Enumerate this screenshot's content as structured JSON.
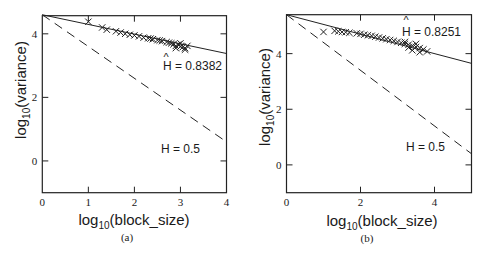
{
  "chart_data": [
    {
      "type": "scatter",
      "panel": "a",
      "caption": "(a)",
      "xlabel": "log10(block_size)",
      "ylabel": "log10(variance)",
      "xlim": [
        0,
        4
      ],
      "ylim": [
        -1,
        4.57
      ],
      "xticks": [
        0,
        1,
        2,
        3,
        4
      ],
      "yticks": [
        0,
        2,
        4
      ],
      "grid": false,
      "legend": null,
      "series": [
        {
          "name": "variance points",
          "marker": "x",
          "x": [
            1.0,
            1.3,
            1.4,
            1.6,
            1.7,
            1.8,
            1.9,
            2.0,
            2.1,
            2.2,
            2.3,
            2.35,
            2.4,
            2.5,
            2.55,
            2.6,
            2.7,
            2.75,
            2.8,
            2.85,
            2.9,
            2.95,
            3.0,
            3.05,
            3.1,
            3.15,
            2.9,
            3.0,
            3.1
          ],
          "y": [
            4.38,
            4.2,
            4.13,
            4.08,
            4.04,
            4.0,
            3.97,
            3.95,
            3.92,
            3.88,
            3.86,
            3.85,
            3.83,
            3.8,
            3.79,
            3.77,
            3.74,
            3.72,
            3.7,
            3.67,
            3.62,
            3.66,
            3.6,
            3.58,
            3.55,
            3.62,
            3.55,
            3.7,
            3.5
          ]
        },
        {
          "name": "fitted line",
          "style": "solid",
          "x": [
            0,
            4
          ],
          "y": [
            4.6,
            3.38
          ]
        },
        {
          "name": "H = 0.5 reference",
          "style": "dashed",
          "x": [
            0,
            4
          ],
          "y": [
            4.6,
            0.6
          ]
        }
      ],
      "annotations": [
        {
          "text": "H = 0.8382",
          "hat": true,
          "x": 2.65,
          "y": 3.0
        },
        {
          "text": "H = 0.5",
          "hat": false,
          "x": 2.63,
          "y": 0.4
        }
      ]
    },
    {
      "type": "scatter",
      "panel": "b",
      "caption": "(b)",
      "xlabel": "log10(block_size)",
      "ylabel": "log10(variance)",
      "xlim": [
        0,
        5
      ],
      "ylim": [
        -1,
        5.4
      ],
      "xticks": [
        0,
        2,
        4
      ],
      "yticks": [
        0,
        2,
        4
      ],
      "grid": false,
      "legend": null,
      "series": [
        {
          "name": "variance points",
          "marker": "x",
          "x": [
            1.0,
            1.3,
            1.4,
            1.5,
            1.6,
            1.7,
            1.9,
            2.0,
            2.1,
            2.2,
            2.3,
            2.4,
            2.5,
            2.6,
            2.7,
            2.8,
            2.9,
            3.0,
            3.1,
            3.2,
            3.3,
            3.4,
            3.5,
            3.6,
            3.7,
            3.8,
            3.2,
            3.4,
            3.5,
            3.6,
            3.3
          ],
          "y": [
            4.78,
            4.82,
            4.8,
            4.78,
            4.77,
            4.75,
            4.73,
            4.71,
            4.68,
            4.66,
            4.64,
            4.61,
            4.58,
            4.55,
            4.52,
            4.49,
            4.46,
            4.42,
            4.39,
            4.35,
            4.32,
            4.28,
            4.24,
            4.2,
            4.15,
            4.08,
            4.42,
            4.12,
            4.35,
            4.05,
            4.22
          ]
        },
        {
          "name": "fitted line",
          "style": "solid",
          "x": [
            0,
            5
          ],
          "y": [
            5.4,
            3.65
          ]
        },
        {
          "name": "H = 0.5 reference",
          "style": "dashed",
          "x": [
            0,
            5
          ],
          "y": [
            5.4,
            0.4
          ]
        }
      ],
      "annotations": [
        {
          "text": "H = 0.8251",
          "hat": true,
          "x": 3.12,
          "y": 4.85
        },
        {
          "text": "H = 0.5",
          "hat": false,
          "x": 3.22,
          "y": 0.6
        }
      ]
    }
  ],
  "figure": {
    "panels": [
      {
        "caption": "(a)",
        "xlabel_main": "log",
        "xlabel_sub": "10",
        "xlabel_rest": "(block_size)",
        "ylabel_main": "log",
        "ylabel_sub": "10",
        "ylabel_rest": "(variance)",
        "annotation_1": "H = 0.8382",
        "annotation_2": "H = 0.5",
        "hat": "^"
      },
      {
        "caption": "(b)",
        "xlabel_main": "log",
        "xlabel_sub": "10",
        "xlabel_rest": "(block_size)",
        "ylabel_main": "log",
        "ylabel_sub": "10",
        "ylabel_rest": "(variance)",
        "annotation_1": "H = 0.8251",
        "annotation_2": "H = 0.5",
        "hat": "^"
      }
    ]
  }
}
